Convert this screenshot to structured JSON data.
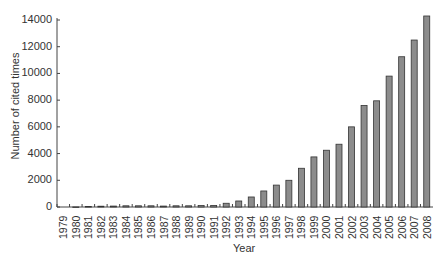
{
  "chart_data": {
    "type": "bar",
    "title": "",
    "xlabel": "Year",
    "ylabel": "Number of cited times",
    "ylim": [
      0,
      14000
    ],
    "yticks": [
      0,
      2000,
      4000,
      6000,
      8000,
      10000,
      12000,
      14000
    ],
    "grid": false,
    "legend": null,
    "bar_color": "#8c8c8c",
    "categories": [
      "1979",
      "1980",
      "1981",
      "1982",
      "1983",
      "1984",
      "1985",
      "1986",
      "1987",
      "1988",
      "1989",
      "1990",
      "1991",
      "1992",
      "1993",
      "1994",
      "1995",
      "1996",
      "1997",
      "1998",
      "1999",
      "2000",
      "2001",
      "2002",
      "2003",
      "2004",
      "2005",
      "2006",
      "2007",
      "2008"
    ],
    "values": [
      0,
      5,
      30,
      60,
      70,
      90,
      90,
      90,
      70,
      90,
      90,
      110,
      120,
      280,
      450,
      750,
      1200,
      1640,
      2000,
      2900,
      3750,
      4250,
      4700,
      6000,
      7600,
      7950,
      9800,
      11250,
      12500,
      14300
    ]
  }
}
